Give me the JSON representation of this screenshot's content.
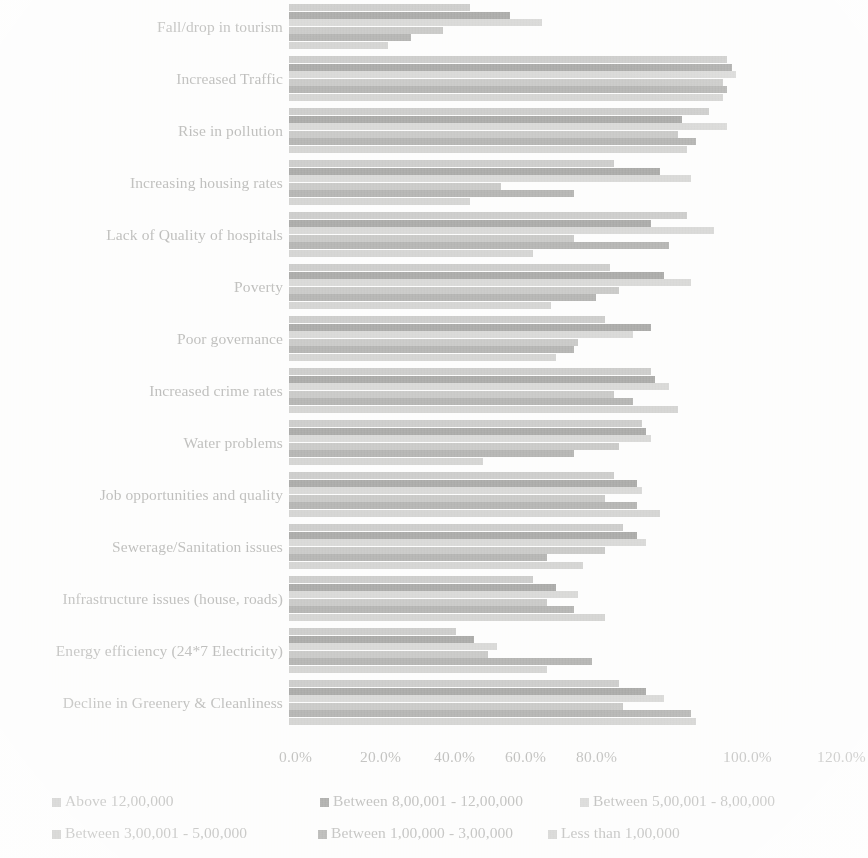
{
  "chart_data": {
    "type": "bar",
    "orientation": "horizontal",
    "grouped": true,
    "title": "",
    "xlabel": "",
    "ylabel": "",
    "xlim": [
      0,
      120
    ],
    "xtick_labels": [
      "0.0%",
      "20.0%",
      "40.0%",
      "60.0%",
      "80.0%",
      "100.0%",
      "120.0%"
    ],
    "xtick_values": [
      0,
      20,
      40,
      60,
      80,
      100,
      120
    ],
    "grid": false,
    "legend_position": "bottom",
    "categories": [
      "Fall/drop in tourism",
      "Increased Traffic",
      "Rise in pollution",
      "Increasing housing rates",
      "Lack of Quality of hospitals",
      "Poverty",
      "Poor governance",
      "Increased crime rates",
      "Water problems",
      "Job opportunities and quality",
      "Sewerage/Sanitation issues",
      "Infrastructure issues (house, roads)",
      "Energy efficiency (24*7 Electricity)",
      "Decline in Greenery & Cleanliness"
    ],
    "series": [
      {
        "name": "Above 12,00,000",
        "color": "#c4c4c2",
        "values": [
          40.0,
          97.0,
          93.0,
          72.0,
          88.0,
          71.0,
          70.0,
          80.0,
          78.0,
          72.0,
          74.0,
          54.0,
          37.0,
          73.0
        ]
      },
      {
        "name": "Between 8,00,001 - 12,00,000",
        "color": "#9c9c9a",
        "values": [
          49.0,
          98.0,
          87.0,
          82.0,
          80.0,
          83.0,
          80.0,
          81.0,
          79.0,
          77.0,
          77.0,
          59.0,
          41.0,
          79.0
        ]
      },
      {
        "name": "Between 5,00,001 - 8,00,000",
        "color": "#d2d2d0",
        "values": [
          56.0,
          99.0,
          97.0,
          89.0,
          94.0,
          89.0,
          76.0,
          84.0,
          80.0,
          78.0,
          79.0,
          64.0,
          46.0,
          83.0
        ]
      },
      {
        "name": "Between 3,00,001 - 5,00,000",
        "color": "#c0c0be",
        "values": [
          34.0,
          96.0,
          86.0,
          47.0,
          63.0,
          73.0,
          64.0,
          72.0,
          73.0,
          70.0,
          70.0,
          57.0,
          44.0,
          74.0
        ]
      },
      {
        "name": "Between 1,00,000 - 3,00,000",
        "color": "#a8a8a6",
        "values": [
          27.0,
          97.0,
          90.0,
          63.0,
          84.0,
          68.0,
          63.0,
          76.0,
          63.0,
          77.0,
          57.0,
          63.0,
          67.0,
          89.0
        ]
      },
      {
        "name": "Less than 1,00,000",
        "color": "#cdcdcb",
        "values": [
          22.0,
          96.0,
          88.0,
          40.0,
          54.0,
          58.0,
          59.0,
          86.0,
          43.0,
          82.0,
          65.0,
          70.0,
          57.0,
          90.0
        ]
      }
    ]
  },
  "legend": {
    "items": [
      {
        "label": "Above 12,00,000",
        "swatch": "legend-swatch-above-12-lakh"
      },
      {
        "label": "Between 8,00,001 - 12,00,000",
        "swatch": "legend-swatch-8-to-12-lakh"
      },
      {
        "label": "Between 5,00,001 - 8,00,000",
        "swatch": "legend-swatch-5-to-8-lakh"
      },
      {
        "label": "Between 3,00,001 - 5,00,000",
        "swatch": "legend-swatch-3-to-5-lakh"
      },
      {
        "label": "Between 1,00,000 - 3,00,000",
        "swatch": "legend-swatch-1-to-3-lakh"
      },
      {
        "label": "Less than 1,00,000",
        "swatch": "legend-swatch-less-than-1-lakh"
      }
    ]
  }
}
